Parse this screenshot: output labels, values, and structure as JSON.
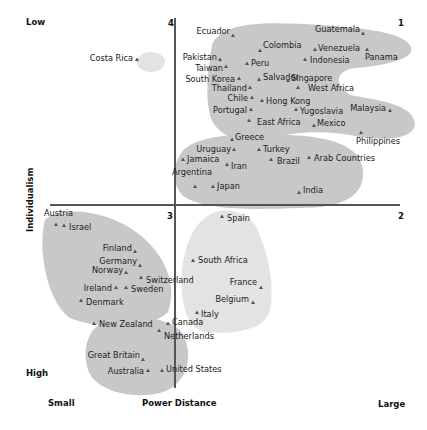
{
  "chart_data": {
    "type": "scatter",
    "title": "",
    "xlabel": "Power Distance",
    "ylabel": "Individualism",
    "x_axis_ends": {
      "left": "Small",
      "right": "Large"
    },
    "y_axis_ends": {
      "top": "Low",
      "bottom": "High"
    },
    "quadrants": {
      "q1": "1",
      "q2": "2",
      "q3": "3",
      "q4": "4"
    },
    "points": [
      {
        "name": "Costa Rica",
        "x": 137,
        "y": 60
      },
      {
        "name": "Ecuador",
        "x": 233,
        "y": 36
      },
      {
        "name": "Guatemala",
        "x": 363,
        "y": 34
      },
      {
        "name": "Colombia",
        "x": 260,
        "y": 51
      },
      {
        "name": "Venezuela",
        "x": 315,
        "y": 50
      },
      {
        "name": "Panama",
        "x": 367,
        "y": 50
      },
      {
        "name": "Pakistan",
        "x": 220,
        "y": 60
      },
      {
        "name": "Indonesia",
        "x": 305,
        "y": 60
      },
      {
        "name": "Peru",
        "x": 247,
        "y": 64
      },
      {
        "name": "Taiwan",
        "x": 226,
        "y": 67
      },
      {
        "name": "South Korea",
        "x": 239,
        "y": 79
      },
      {
        "name": "Salvador",
        "x": 259,
        "y": 80
      },
      {
        "name": "Singapore",
        "x": 288,
        "y": 81
      },
      {
        "name": "Thailand",
        "x": 250,
        "y": 88
      },
      {
        "name": "West Africa",
        "x": 298,
        "y": 88
      },
      {
        "name": "Chile",
        "x": 252,
        "y": 98
      },
      {
        "name": "Hong Kong",
        "x": 262,
        "y": 101
      },
      {
        "name": "Portugal",
        "x": 251,
        "y": 110
      },
      {
        "name": "Yugoslavia",
        "x": 296,
        "y": 110
      },
      {
        "name": "Malaysia",
        "x": 390,
        "y": 111
      },
      {
        "name": "East Africa",
        "x": 249,
        "y": 121
      },
      {
        "name": "Mexico",
        "x": 314,
        "y": 126
      },
      {
        "name": "Philippines",
        "x": 361,
        "y": 133
      },
      {
        "name": "Greece",
        "x": 232,
        "y": 140
      },
      {
        "name": "Uruguay",
        "x": 234,
        "y": 150
      },
      {
        "name": "Turkey",
        "x": 259,
        "y": 150
      },
      {
        "name": "Jamaica",
        "x": 183,
        "y": 160
      },
      {
        "name": "Iran",
        "x": 227,
        "y": 165
      },
      {
        "name": "Brazil",
        "x": 271,
        "y": 160
      },
      {
        "name": "Arab Countries",
        "x": 309,
        "y": 158
      },
      {
        "name": "Argentina",
        "x": 195,
        "y": 187
      },
      {
        "name": "Japan",
        "x": 213,
        "y": 187
      },
      {
        "name": "India",
        "x": 299,
        "y": 193
      },
      {
        "name": "Spain",
        "x": 222,
        "y": 217
      },
      {
        "name": "Austria",
        "x": 56,
        "y": 225
      },
      {
        "name": "Israel",
        "x": 64,
        "y": 226
      },
      {
        "name": "Finland",
        "x": 135,
        "y": 252
      },
      {
        "name": "Germany",
        "x": 140,
        "y": 266
      },
      {
        "name": "South Africa",
        "x": 193,
        "y": 261
      },
      {
        "name": "Norway",
        "x": 126,
        "y": 273
      },
      {
        "name": "Switzerland",
        "x": 141,
        "y": 278
      },
      {
        "name": "France",
        "x": 261,
        "y": 288
      },
      {
        "name": "Ireland",
        "x": 116,
        "y": 288
      },
      {
        "name": "Sweden",
        "x": 126,
        "y": 288
      },
      {
        "name": "Denmark",
        "x": 81,
        "y": 301
      },
      {
        "name": "Belgium",
        "x": 253,
        "y": 303
      },
      {
        "name": "Italy",
        "x": 197,
        "y": 313
      },
      {
        "name": "New Zealand",
        "x": 94,
        "y": 324
      },
      {
        "name": "Canada",
        "x": 168,
        "y": 324
      },
      {
        "name": "Netherlands",
        "x": 159,
        "y": 331
      },
      {
        "name": "Great Britain",
        "x": 143,
        "y": 360
      },
      {
        "name": "Australia",
        "x": 148,
        "y": 371
      },
      {
        "name": "United States",
        "x": 162,
        "y": 371
      }
    ],
    "clusters": [
      {
        "name": "Costa Rica group",
        "shade": "#e3e3e3"
      },
      {
        "name": "Latin America / Asia group",
        "shade": "#c8c8c8"
      },
      {
        "name": "Mediterranean / Latin group",
        "shade": "#c8c8c8"
      },
      {
        "name": "Germanic / Nordic group",
        "shade": "#c8c8c8"
      },
      {
        "name": "Latin Europe group",
        "shade": "#e3e3e3"
      },
      {
        "name": "Anglo group",
        "shade": "#c8c8c8"
      }
    ],
    "grid": false
  }
}
